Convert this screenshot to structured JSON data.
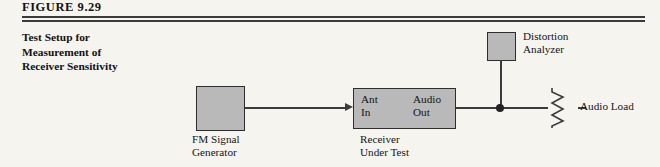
{
  "figure": {
    "number_label": "FIGURE 9.29",
    "caption_lines": [
      "Test Setup for",
      "Measurement of",
      "Receiver Sensitivity"
    ]
  },
  "diagram": {
    "type": "block-diagram",
    "blocks": [
      {
        "id": "fm-signal-generator",
        "label_line1": "FM Signal",
        "label_line2": "Generator",
        "fill": "#b9b9b9",
        "stroke": "#2d2d2f"
      },
      {
        "id": "receiver-under-test",
        "label_line1": "Receiver",
        "label_line2": "Under Test",
        "port_in_line1": "Ant",
        "port_in_line2": "In",
        "port_out_line1": "Audio",
        "port_out_line2": "Out",
        "fill": "#b9b9b9",
        "stroke": "#2d2d2f"
      },
      {
        "id": "distortion-analyzer",
        "label_line1": "Distortion",
        "label_line2": "Analyzer",
        "fill": "#b9b9b9",
        "stroke": "#2d2d2f"
      }
    ],
    "load": {
      "id": "audio-load",
      "label": "Audio Load",
      "symbol": "resistor"
    },
    "connections": [
      {
        "from": "fm-signal-generator",
        "to": "receiver-under-test",
        "arrow": true
      },
      {
        "from": "receiver-under-test",
        "to": "audio-load",
        "arrow": false
      },
      {
        "from": "distortion-analyzer",
        "to": "audio-output-node",
        "arrow": false
      }
    ],
    "wire_color": "#3b3b3d",
    "background": "#f6f4ef"
  }
}
